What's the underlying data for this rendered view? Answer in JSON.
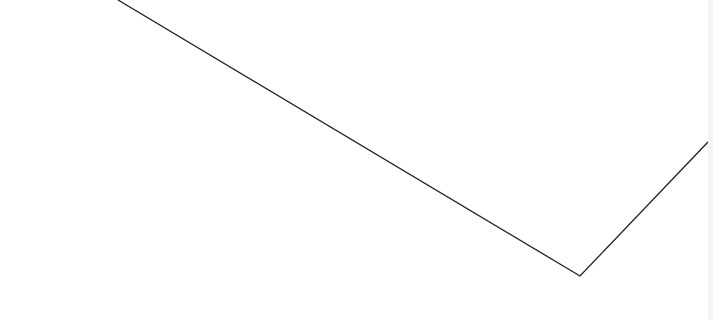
{
  "canvas": {
    "background": "#ffffff",
    "stroke_color": "#222222",
    "edge_strip_color": "#f4f4f4",
    "polyline_points": "118,0 580,276 708,142"
  }
}
